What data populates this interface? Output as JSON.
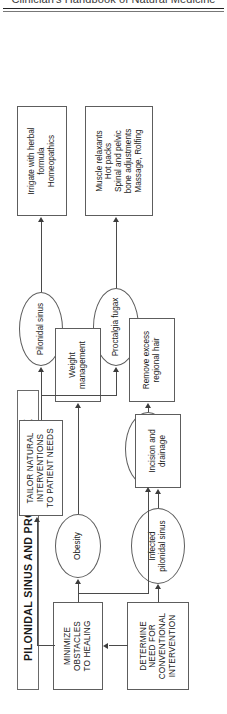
{
  "page": {
    "running_header": "Clinician's Handbook of Natural Medicine"
  },
  "diagram": {
    "title": "PILONIDAL SINUS AND PROCTALGIA FUGAX",
    "type": "flowchart",
    "orientation": "rotated-90-counterclockwise",
    "stages": [
      {
        "id": "determine",
        "label": "DETERMINE\nNEED FOR\nCONVENTIONAL\nINTERVENTION",
        "line1": "DETERMINE",
        "line2": "NEED FOR",
        "line3": "CONVENTIONAL",
        "line4": "INTERVENTION",
        "shape": "box"
      },
      {
        "id": "minimize",
        "line1": "MINIMIZE",
        "line2": "OBSTACLES",
        "line3": "TO HEALING",
        "shape": "box"
      },
      {
        "id": "tailor",
        "line1": "TAILOR NATURAL",
        "line2": "INTERVENTIONS",
        "line3": "TO PATIENT NEEDS",
        "shape": "box"
      }
    ],
    "conditions": [
      {
        "id": "infected-pilonidal-sinus",
        "line1": "Infected",
        "line2": "pilonidal sinus",
        "shape": "ellipse"
      },
      {
        "id": "obesity",
        "line1": "Obesity",
        "line2": "",
        "shape": "ellipse"
      },
      {
        "id": "pilonidal-sinus-hair",
        "line1": "Pilonidal sinus",
        "line2": "",
        "shape": "ellipse"
      },
      {
        "id": "pilonidal-sinus-natural",
        "line1": "Pilonidal sinus",
        "line2": "",
        "shape": "ellipse"
      },
      {
        "id": "proctalgia-fugax",
        "line1": "Proctalgia fugax",
        "line2": "",
        "shape": "ellipse"
      }
    ],
    "treatments": [
      {
        "id": "incision-drainage",
        "line1": "Incision and",
        "line2": "drainage",
        "line3": "",
        "line4": "",
        "shape": "box"
      },
      {
        "id": "weight-management",
        "line1": "Weight",
        "line2": "management",
        "line3": "",
        "line4": "",
        "shape": "box"
      },
      {
        "id": "remove-excess-hair",
        "line1": "Remove excess",
        "line2": "regional hair",
        "line3": "",
        "line4": "",
        "shape": "box"
      },
      {
        "id": "irrigate-herbal",
        "line1": "Irrigate with herbal",
        "line2": "formula",
        "line3": "Homeopathics",
        "line4": "",
        "shape": "box"
      },
      {
        "id": "proctalgia-treatments",
        "line1": "Muscle relaxants",
        "line2": "Hot packs",
        "line3": "Spinal and pelvic",
        "line4": "bone adjustments",
        "line5": "Massage, Rolfing",
        "shape": "box"
      }
    ]
  }
}
